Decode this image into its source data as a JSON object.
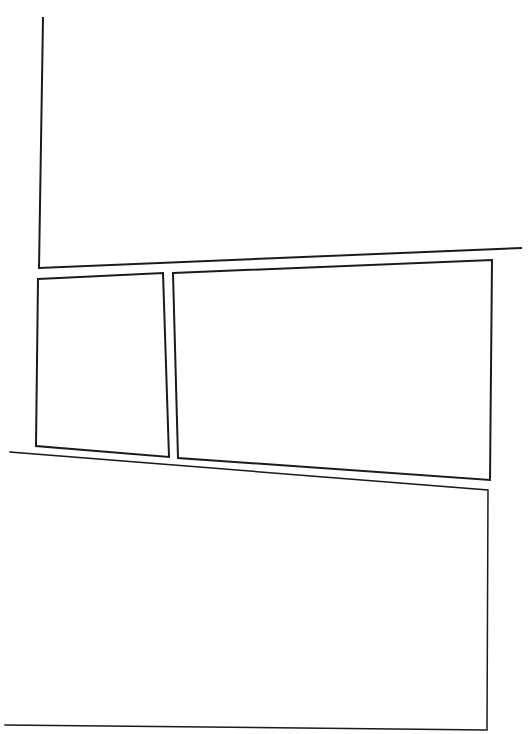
{
  "page": {
    "type": "comic-panel-layout",
    "background": "#ffffff",
    "ink_color": "#1a1a1a",
    "panel_count": 4
  },
  "panels": [
    {
      "id": "panel-1",
      "label": "",
      "points": "43,18 39,268 521,248",
      "closed": false,
      "stroke_width": 2
    },
    {
      "id": "panel-2",
      "label": "",
      "points": "38,279 163,273 169,457 36,446",
      "closed": true,
      "stroke_width": 2
    },
    {
      "id": "panel-3",
      "label": "",
      "points": "173,273 492,260 490,480 178,458",
      "closed": true,
      "stroke_width": 2
    },
    {
      "id": "panel-4",
      "label": "",
      "points": "10,452 488,490 487,730 5,725",
      "closed": false,
      "stroke_width": 1.5
    }
  ]
}
